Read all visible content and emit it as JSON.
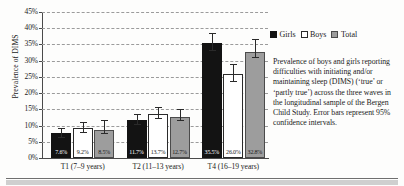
{
  "chart_data": {
    "type": "bar",
    "title": "",
    "xlabel": "",
    "ylabel": "Prevalence of DIMS",
    "ylim": [
      0,
      45
    ],
    "grid": true,
    "legend_position": "top-right",
    "categories": [
      "T1 (7–9 years)",
      "T2 (11–13 years)",
      "T4 (16–19 years)"
    ],
    "ytick_labels": [
      "0%",
      "5%",
      "10%",
      "15%",
      "20%",
      "25%",
      "30%",
      "35%",
      "40%",
      "45%"
    ],
    "ytick_values": [
      0,
      5,
      10,
      15,
      20,
      25,
      30,
      35,
      40,
      45
    ],
    "series": [
      {
        "name": "Girls",
        "color": "#131313",
        "values": [
          7.6,
          11.7,
          35.5
        ],
        "labels": [
          "7.6%",
          "11.7%",
          "35.5%"
        ],
        "err_low": [
          6.3,
          10.2,
          33.0
        ],
        "err_high": [
          9.0,
          13.2,
          38.1
        ]
      },
      {
        "name": "Boys",
        "color": "#ffffff",
        "values": [
          9.2,
          13.7,
          26.0
        ],
        "labels": [
          "9.2%",
          "13.7%",
          "26.0%"
        ],
        "err_low": [
          7.8,
          12.1,
          23.5
        ],
        "err_high": [
          10.7,
          15.3,
          28.6
        ]
      },
      {
        "name": "Total",
        "color": "#9d9d9d",
        "values": [
          8.5,
          12.7,
          32.8
        ],
        "labels": [
          "8.5%",
          "12.7%",
          "32.8%"
        ],
        "err_low": [
          7.4,
          11.5,
          30.8
        ],
        "err_high": [
          11.4,
          14.9,
          36.3
        ]
      }
    ]
  },
  "legend": {
    "items": [
      {
        "label": "Girls",
        "swatch": "girls"
      },
      {
        "label": "Boys",
        "swatch": "boys"
      },
      {
        "label": "Total",
        "swatch": "total"
      }
    ]
  },
  "caption": {
    "text": "Prevalence of boys and girls reporting difficulties with initiating and/or maintaining sleep (DIMS) (‘true’ or ‘partly true’) across the three waves in the longitudinal sample of the Bergen Child Study. Error bars represent 95% confidence intervals."
  }
}
